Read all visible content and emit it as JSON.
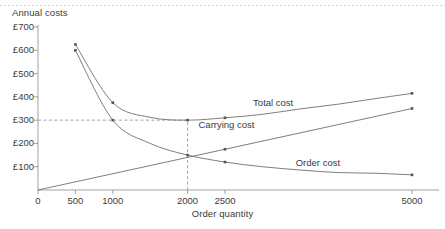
{
  "figure": {
    "header_rule": "dotted-separator"
  },
  "chart_data": {
    "type": "line",
    "title": "",
    "ylabel": "Annual costs",
    "xlabel": "Order quantity",
    "currency_symbol": "£",
    "xlim": [
      0,
      5400
    ],
    "ylim": [
      0,
      700
    ],
    "grid": false,
    "legend": "inline-labels",
    "x_ticks": [
      0,
      500,
      1000,
      2000,
      2500,
      5000
    ],
    "x_tick_labels": [
      "0",
      "500",
      "1000",
      "2000",
      "2500",
      "5000"
    ],
    "y_ticks": [
      100,
      200,
      300,
      400,
      500,
      600,
      700
    ],
    "y_tick_labels": [
      "£100",
      "£200",
      "£300",
      "£400",
      "£500",
      "£600",
      "£700"
    ],
    "reference_lines": [
      {
        "name": "optimal-cost-line",
        "orientation": "horizontal",
        "value": 300,
        "style": "dashed",
        "from_x": 0,
        "to_x": 2000
      },
      {
        "name": "economic-order-quantity-line",
        "orientation": "vertical",
        "value": 2000,
        "style": "dashed",
        "from_y": 0,
        "to_y": 300
      }
    ],
    "series": [
      {
        "name": "Total cost",
        "label": "Total cost",
        "label_x": 3250,
        "label_y": 372,
        "color": "#6f6f6f",
        "markers": [
          500,
          1000,
          2000,
          2500,
          5000
        ],
        "x": [
          500,
          1000,
          1500,
          2000,
          2500,
          3000,
          3500,
          4000,
          4500,
          5000
        ],
        "values": [
          625,
          375,
          312,
          300,
          310,
          325,
          348,
          368,
          392,
          415
        ]
      },
      {
        "name": "Carrying cost",
        "label": "Carrying cost",
        "label_x": 2520,
        "label_y": 278,
        "color": "#6f6f6f",
        "markers": [
          2500,
          5000
        ],
        "x": [
          0,
          5000
        ],
        "values": [
          0,
          350
        ]
      },
      {
        "name": "Order cost",
        "label": "Order cost",
        "label_x": 3820,
        "label_y": 118,
        "color": "#6f6f6f",
        "markers": [
          500,
          1000,
          2000,
          2500,
          5000
        ],
        "x": [
          500,
          1000,
          1500,
          2000,
          2500,
          3000,
          3500,
          4000,
          4500,
          5000
        ],
        "values": [
          600,
          300,
          200,
          150,
          120,
          100,
          86,
          75,
          72,
          65
        ]
      }
    ],
    "annotations": [
      {
        "name": "eoq-intersection",
        "x": 2000,
        "y": 150,
        "note": "carrying cost meets order cost"
      },
      {
        "name": "minimum-total-cost",
        "x": 2000,
        "y": 300,
        "note": "total cost minimum"
      }
    ],
    "colors": {
      "line": "#6f6f6f",
      "axis": "#8c8c8c",
      "text": "#3b3b3b",
      "dash": "#9a9a9a",
      "background": "#ffffff"
    }
  }
}
